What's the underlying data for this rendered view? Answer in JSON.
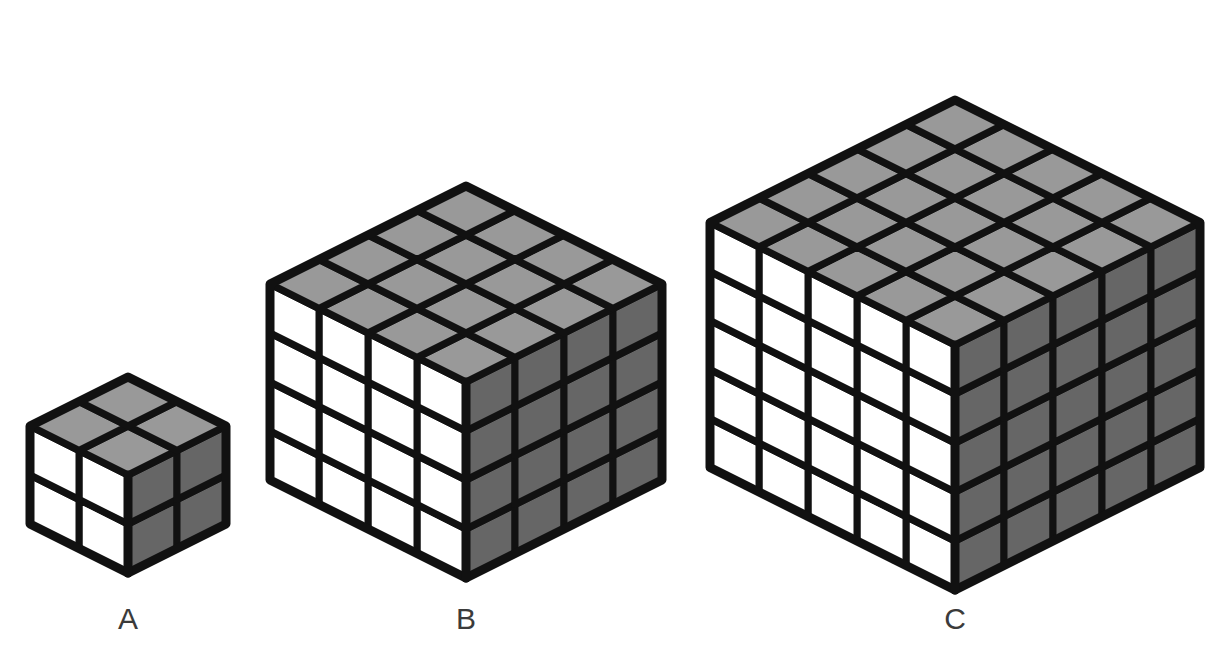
{
  "figure": {
    "title": "",
    "background_color": "#ffffff"
  },
  "chart_data": {
    "type": "diagram",
    "subtype": "isometric-cube-series",
    "title": "",
    "xlabel": "",
    "ylabel": "",
    "categories": [
      "A",
      "B",
      "C"
    ],
    "values": [
      2,
      4,
      5
    ],
    "value_meaning": "edge length in unit cubes (n of an n x n x n cube)",
    "series": [
      {
        "name": "edge length (cubes)",
        "values": [
          2,
          4,
          5
        ]
      },
      {
        "name": "total unit cubes (n^3)",
        "values": [
          8,
          64,
          125
        ]
      },
      {
        "name": "visible faces per cube face (n^2)",
        "values": [
          4,
          16,
          25
        ]
      }
    ],
    "annotations": [
      "Cube A is 2 x 2 x 2",
      "Cube B is 4 x 4 x 4",
      "Cube C is 5 x 5 x 5"
    ],
    "legend_position": "none",
    "grid": false
  },
  "colors": {
    "top_face": "#999999",
    "right_face": "#666666",
    "left_face": "#ffffff",
    "outline": "#111111",
    "label_text": "#3b3b3b",
    "background": "#ffffff"
  },
  "geometry": {
    "unit": 49,
    "stroke_outer": 9,
    "stroke_inner": 7
  },
  "cubes": [
    {
      "id": "cube-a",
      "label": "A",
      "n": 2,
      "center_x": 128,
      "base_y": 573,
      "label_x": 128,
      "label_y": 604
    },
    {
      "id": "cube-b",
      "label": "B",
      "n": 4,
      "center_x": 466,
      "base_y": 578,
      "label_x": 466,
      "label_y": 604
    },
    {
      "id": "cube-c",
      "label": "C",
      "n": 5,
      "center_x": 955,
      "base_y": 590,
      "label_x": 955,
      "label_y": 604
    }
  ]
}
